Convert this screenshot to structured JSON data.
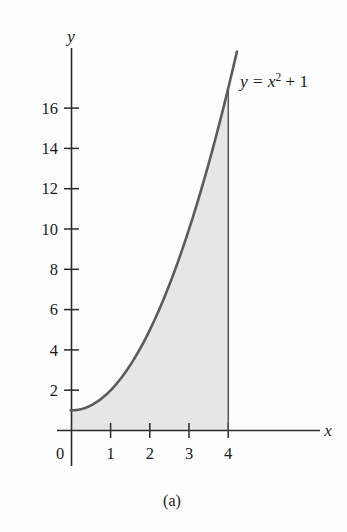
{
  "figure": {
    "caption": "(a)",
    "curve_label": {
      "full": "y = x² + 1",
      "lhs": "y",
      "equals": "=",
      "base": "x",
      "exponent": "2",
      "plus_term": "+ 1"
    },
    "axes": {
      "x_axis_name": "x",
      "y_axis_name": "y",
      "origin_label": "0",
      "x_ticks": [
        1,
        2,
        3,
        4
      ],
      "x_tick_labels": [
        "1",
        "2",
        "3",
        "4"
      ],
      "y_ticks": [
        2,
        4,
        6,
        8,
        10,
        12,
        14,
        16
      ],
      "y_tick_labels": [
        "2",
        "4",
        "6",
        "8",
        "10",
        "12",
        "14",
        "16"
      ]
    },
    "colors": {
      "axis": "#2b2b2b",
      "curve": "#5b5b5b",
      "shade": "#e6e6e6",
      "text": "#1c1c1c",
      "background": "#fdfdfd"
    }
  },
  "chart_data": {
    "type": "line",
    "title": "",
    "subtitle": "",
    "xlabel": "x",
    "ylabel": "y",
    "xlim": [
      -0.35,
      6.6
    ],
    "ylim": [
      -1.5,
      18.5
    ],
    "grid": false,
    "legend": "none",
    "annotations": [
      {
        "text": "y = x² + 1",
        "x": 4.3,
        "y": 16.8,
        "role": "curve-label"
      },
      {
        "text": "(a)",
        "x": 2.5,
        "y": -3.5,
        "role": "figure-caption"
      }
    ],
    "series": [
      {
        "name": "y = x^2 + 1",
        "equation": "y = x^2 + 1",
        "x": [
          0,
          0.25,
          0.5,
          0.75,
          1,
          1.25,
          1.5,
          1.75,
          2,
          2.25,
          2.5,
          2.75,
          3,
          3.25,
          3.5,
          3.75,
          4,
          4.1
        ],
        "y": [
          1,
          1.0625,
          1.25,
          1.5625,
          2,
          2.5625,
          3.25,
          4.0625,
          5,
          6.0625,
          7.25,
          8.5625,
          10,
          11.5625,
          13.25,
          15.0625,
          17,
          17.81
        ]
      }
    ],
    "shaded_region": {
      "description": "Area under y = x^2 + 1 from x = 0 to x = 4",
      "x_from": 0,
      "x_to": 4,
      "y_from": 0,
      "fill": "#e6e6e6"
    },
    "x_ticks": [
      1,
      2,
      3,
      4
    ],
    "y_ticks": [
      2,
      4,
      6,
      8,
      10,
      12,
      14,
      16
    ]
  }
}
